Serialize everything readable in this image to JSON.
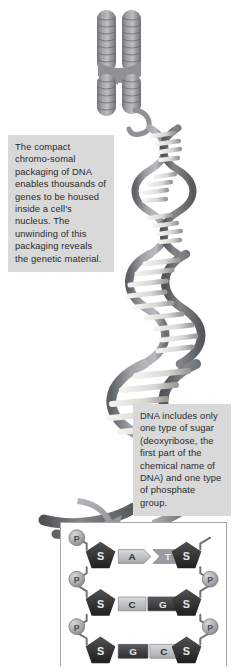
{
  "figure": {
    "background_color": "#ffffff"
  },
  "callouts": [
    {
      "id": "chromosome-packaging",
      "text": "The compact chromo-somal packaging of DNA enables thousands of genes to be housed inside a cell's nucleus. The unwinding of this packaging reveals the genetic material.",
      "lines": [
        "The compact chromo-",
        "somal packaging of",
        "DNA enables thousands",
        "of genes to be housed",
        "inside a cell's nucleus.",
        "The unwinding of this",
        "packaging reveals the",
        "genetic material."
      ],
      "background_color": "#d9d9d9",
      "text_color": "#2a2a2a"
    },
    {
      "id": "sugar-phosphate",
      "text": "DNA includes only one type of sugar (deoxyribose, the first part of the chemical name of DNA) and one type of phosphate group.",
      "lines": [
        "DNA includes only",
        "one type of sugar",
        "(deoxyribose, the",
        "first part of the",
        "chemical name of",
        "DNA) and one type",
        "of phosphate group."
      ],
      "background_color": "#d9d9d9",
      "text_color": "#2a2a2a"
    }
  ],
  "chromosome": {
    "label": "chromosome",
    "shape": "X-shaped banded chromosome",
    "color": "#8f9396",
    "band_color": "#6e7276"
  },
  "dna_helix": {
    "label": "DNA double helix",
    "backbone_color": "#8a8e92",
    "rung_color": "#e8e8e6",
    "turns": 6
  },
  "arrow": {
    "name": "zoom-arrow",
    "color": "#9a9ea1",
    "direction": "down-right"
  },
  "base_pair_panel": {
    "border_color": "#a7a7a7",
    "background_color": "#ffffff",
    "phosphate_label": "P",
    "sugar_label": "S",
    "phosphate_color": "#a8acae",
    "sugar_color": "#3a3a3a",
    "rows": [
      {
        "left_phosphate": "P",
        "left_sugar": "S",
        "left_base": "A",
        "right_base": "T",
        "right_sugar": "S",
        "right_phosphate": "P",
        "left_base_color": "#b9bcbe",
        "right_base_color": "#9a9da0"
      },
      {
        "left_phosphate": "P",
        "left_sugar": "S",
        "left_base": "C",
        "right_base": "G",
        "right_sugar": "S",
        "right_phosphate": "P",
        "left_base_color": "#c3c6c8",
        "right_base_color": "#3f4143"
      },
      {
        "left_phosphate": "P",
        "left_sugar": "S",
        "left_base": "G",
        "right_base": "C",
        "right_sugar": "S",
        "right_phosphate": "P",
        "left_base_color": "#3f4143",
        "right_base_color": "#c3c6c8"
      }
    ]
  }
}
